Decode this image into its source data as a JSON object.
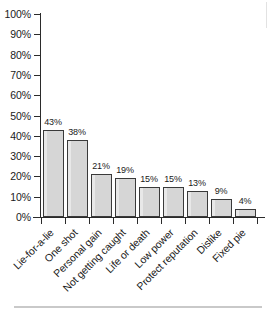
{
  "chart_data": {
    "type": "bar",
    "title": "",
    "subtitle": "",
    "xlabel": "",
    "ylabel": "",
    "ylim": [
      0,
      100
    ],
    "y_tick_labels": [
      "100%",
      "90%",
      "80%",
      "70%",
      "60%",
      "50%",
      "40%",
      "30%",
      "20%",
      "10%",
      "0%"
    ],
    "y_tick_values": [
      100,
      90,
      80,
      70,
      60,
      50,
      40,
      30,
      20,
      10,
      0
    ],
    "grid": false,
    "legend": "none",
    "categories": [
      "Lie-for-a-lie",
      "One shot",
      "Personal gain",
      "Not getting caught",
      "Life or death",
      "Low power",
      "Protect reputation",
      "Dislike",
      "Fixed pie"
    ],
    "values": [
      43,
      38,
      21,
      19,
      15,
      15,
      13,
      9,
      4
    ],
    "value_labels": [
      "43%",
      "38%",
      "21%",
      "19%",
      "15%",
      "15%",
      "13%",
      "9%",
      "4%"
    ],
    "bar_fill_color": "#d6d6d6",
    "bar_border_color": "#3a3a3a",
    "axis_color": "#2b2b2b",
    "text_color": "#1a1a1a",
    "background_color": "#ffffff"
  }
}
